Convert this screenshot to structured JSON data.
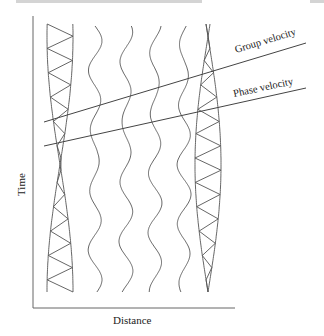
{
  "figure": {
    "type": "space-time wave packet diagram",
    "x_axis_label": "Distance",
    "y_axis_label": "Time",
    "lines": [
      {
        "id": "group",
        "label": "Group velocity"
      },
      {
        "id": "phase",
        "label": "Phase velocity"
      }
    ],
    "wave_traces": 4,
    "envelopes": 2
  },
  "colors": {
    "stroke": "#555555",
    "text": "#222222",
    "header_bar": "#d4d4d4"
  }
}
